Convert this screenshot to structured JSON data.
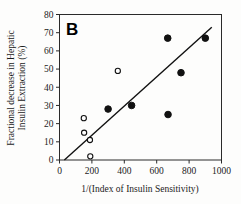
{
  "figure": {
    "panel_label": "B",
    "background_color": "#fdfdfc",
    "axis_color": "#2a2a2a",
    "marker_color": "#111111"
  },
  "chart_data": {
    "type": "scatter",
    "title": "",
    "panel": "B",
    "xlabel": "1/(Index of Insulin Sensitivity)",
    "ylabel": "Fractional decrease in Hepatic Insulin Extraction (%)",
    "ylabel_line1": "Fractional decrease in Hepatic",
    "ylabel_line2": "Insulin Extraction (%)",
    "xlim": [
      0,
      1000
    ],
    "ylim": [
      0,
      80
    ],
    "xticks": [
      0,
      200,
      400,
      600,
      800,
      1000
    ],
    "yticks": [
      0,
      10,
      20,
      30,
      40,
      50,
      60,
      70,
      80
    ],
    "xtick_labels": [
      "0",
      "200",
      "400",
      "600",
      "800",
      "1000"
    ],
    "ytick_labels": [
      "0",
      "10",
      "20",
      "30",
      "40",
      "50",
      "60",
      "70",
      "80"
    ],
    "grid": false,
    "legend": "none",
    "series": [
      {
        "name": "open-circles",
        "marker": "open-circle",
        "points": [
          {
            "x": 150,
            "y": 23
          },
          {
            "x": 152,
            "y": 15
          },
          {
            "x": 188,
            "y": 11
          },
          {
            "x": 190,
            "y": 2
          },
          {
            "x": 360,
            "y": 49
          }
        ]
      },
      {
        "name": "filled-circles",
        "marker": "filled-circle",
        "points": [
          {
            "x": 300,
            "y": 28
          },
          {
            "x": 445,
            "y": 30
          },
          {
            "x": 668,
            "y": 67
          },
          {
            "x": 670,
            "y": 25
          },
          {
            "x": 750,
            "y": 48
          },
          {
            "x": 900,
            "y": 67
          }
        ]
      }
    ],
    "fit_line": {
      "name": "regression-line",
      "x1": 30,
      "y1": 0,
      "x2": 940,
      "y2": 73
    }
  }
}
